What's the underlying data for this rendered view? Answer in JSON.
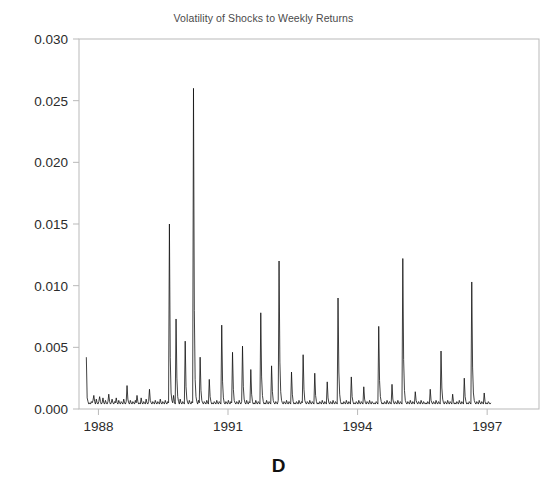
{
  "chart_data": {
    "type": "line",
    "title": "Volatility of Shocks to Weekly Returns",
    "panel_label": "D",
    "xlabel": "",
    "ylabel": "",
    "xlim": [
      1987.55,
      1998.2
    ],
    "ylim": [
      0.0,
      0.03
    ],
    "grid": false,
    "legend": null,
    "series_name": "volatility",
    "line_color": "#111111",
    "line_width": 0.8,
    "axis_color": "#b9b9b9",
    "xticks": [
      1988,
      1991,
      1994,
      1997
    ],
    "xtick_labels": [
      "1988",
      "1991",
      "1994",
      "1997"
    ],
    "yticks": [
      0.0,
      0.005,
      0.01,
      0.015,
      0.02,
      0.025,
      0.03
    ],
    "ytick_labels": [
      "0.000",
      "0.005",
      "0.010",
      "0.015",
      "0.020",
      "0.025",
      "0.030"
    ],
    "x_start": 1987.72,
    "x_step": 0.019230769,
    "values": [
      0.0042,
      0.0009,
      0.0006,
      0.0004,
      0.0005,
      0.0004,
      0.0006,
      0.0005,
      0.0007,
      0.0011,
      0.0006,
      0.0004,
      0.0008,
      0.0005,
      0.0004,
      0.0006,
      0.001,
      0.0006,
      0.0004,
      0.0005,
      0.0009,
      0.0005,
      0.0004,
      0.0007,
      0.0005,
      0.0004,
      0.0006,
      0.0012,
      0.0006,
      0.0004,
      0.0005,
      0.0008,
      0.0005,
      0.0004,
      0.0006,
      0.0005,
      0.0009,
      0.0005,
      0.0004,
      0.0007,
      0.0005,
      0.0004,
      0.0006,
      0.0005,
      0.0004,
      0.0008,
      0.0005,
      0.0004,
      0.0006,
      0.0019,
      0.0008,
      0.0005,
      0.0004,
      0.0007,
      0.0005,
      0.0004,
      0.0006,
      0.0005,
      0.0004,
      0.0007,
      0.0005,
      0.0011,
      0.0006,
      0.0004,
      0.0005,
      0.0004,
      0.0009,
      0.0005,
      0.0004,
      0.0006,
      0.0005,
      0.0004,
      0.0008,
      0.0005,
      0.0004,
      0.0006,
      0.0016,
      0.0007,
      0.0005,
      0.0004,
      0.0006,
      0.0005,
      0.0004,
      0.0007,
      0.0005,
      0.0004,
      0.0006,
      0.0005,
      0.0004,
      0.0008,
      0.0005,
      0.0004,
      0.0006,
      0.0005,
      0.0004,
      0.0007,
      0.0005,
      0.0004,
      0.0006,
      0.0005,
      0.015,
      0.0042,
      0.0013,
      0.0007,
      0.0005,
      0.0011,
      0.0006,
      0.0004,
      0.0073,
      0.0025,
      0.001,
      0.0006,
      0.0004,
      0.0008,
      0.0005,
      0.0004,
      0.0006,
      0.0005,
      0.0004,
      0.0055,
      0.0018,
      0.0008,
      0.0005,
      0.0004,
      0.0007,
      0.0005,
      0.0004,
      0.0006,
      0.0005,
      0.026,
      0.008,
      0.0024,
      0.001,
      0.0006,
      0.0004,
      0.0007,
      0.0005,
      0.0042,
      0.0015,
      0.0007,
      0.0005,
      0.0004,
      0.0006,
      0.0005,
      0.0004,
      0.0007,
      0.0005,
      0.0004,
      0.0024,
      0.001,
      0.0006,
      0.0004,
      0.0005,
      0.0004,
      0.0006,
      0.0005,
      0.0004,
      0.0007,
      0.0005,
      0.0004,
      0.0006,
      0.0005,
      0.0004,
      0.0068,
      0.0022,
      0.0009,
      0.0005,
      0.0004,
      0.0006,
      0.0005,
      0.0004,
      0.0007,
      0.0005,
      0.0004,
      0.0006,
      0.0005,
      0.0046,
      0.0016,
      0.0007,
      0.0005,
      0.0004,
      0.0006,
      0.0005,
      0.0004,
      0.0007,
      0.0005,
      0.0004,
      0.0006,
      0.0051,
      0.0018,
      0.0008,
      0.0005,
      0.0004,
      0.0007,
      0.0005,
      0.0004,
      0.0006,
      0.0005,
      0.0032,
      0.0012,
      0.0006,
      0.0004,
      0.0005,
      0.0004,
      0.0007,
      0.0005,
      0.0004,
      0.0006,
      0.0005,
      0.0004,
      0.0078,
      0.0026,
      0.0011,
      0.0006,
      0.0004,
      0.0005,
      0.0004,
      0.0007,
      0.0005,
      0.0004,
      0.0006,
      0.0005,
      0.0004,
      0.0035,
      0.0014,
      0.0007,
      0.0005,
      0.0004,
      0.0006,
      0.0005,
      0.0004,
      0.0007,
      0.012,
      0.0038,
      0.0014,
      0.0007,
      0.0005,
      0.0004,
      0.0006,
      0.0005,
      0.0004,
      0.0007,
      0.0005,
      0.0004,
      0.0006,
      0.0005,
      0.0004,
      0.003,
      0.0012,
      0.0006,
      0.0004,
      0.0005,
      0.0004,
      0.0006,
      0.0005,
      0.0004,
      0.0007,
      0.0005,
      0.0004,
      0.0006,
      0.0005,
      0.0044,
      0.0016,
      0.0007,
      0.0005,
      0.0004,
      0.0006,
      0.0005,
      0.0004,
      0.0007,
      0.0005,
      0.0004,
      0.0006,
      0.0005,
      0.0004,
      0.0029,
      0.0011,
      0.0006,
      0.0004,
      0.0005,
      0.0004,
      0.0006,
      0.0005,
      0.0004,
      0.0007,
      0.0005,
      0.0004,
      0.0006,
      0.0005,
      0.0004,
      0.0022,
      0.0009,
      0.0005,
      0.0004,
      0.0006,
      0.0005,
      0.0004,
      0.0007,
      0.0005,
      0.0004,
      0.0006,
      0.0005,
      0.0004,
      0.009,
      0.003,
      0.0012,
      0.0006,
      0.0004,
      0.0005,
      0.0004,
      0.0006,
      0.0005,
      0.0004,
      0.0007,
      0.0005,
      0.0004,
      0.0006,
      0.0005,
      0.0004,
      0.0026,
      0.001,
      0.0006,
      0.0004,
      0.0005,
      0.0004,
      0.0006,
      0.0005,
      0.0004,
      0.0007,
      0.0005,
      0.0004,
      0.0006,
      0.0005,
      0.0004,
      0.0018,
      0.0008,
      0.0005,
      0.0004,
      0.0006,
      0.0005,
      0.0004,
      0.0007,
      0.0005,
      0.0004,
      0.0006,
      0.0005,
      0.0004,
      0.0005,
      0.0004,
      0.0006,
      0.0005,
      0.0004,
      0.0067,
      0.0023,
      0.001,
      0.0006,
      0.0004,
      0.0005,
      0.0004,
      0.0006,
      0.0005,
      0.0004,
      0.0007,
      0.0005,
      0.0004,
      0.0006,
      0.0005,
      0.0004,
      0.002,
      0.0008,
      0.0005,
      0.0004,
      0.0006,
      0.0005,
      0.0004,
      0.0007,
      0.0005,
      0.0004,
      0.0006,
      0.0005,
      0.0004,
      0.0122,
      0.004,
      0.0015,
      0.0007,
      0.0005,
      0.0004,
      0.0006,
      0.0005,
      0.0004,
      0.0007,
      0.0005,
      0.0004,
      0.0006,
      0.0005,
      0.0004,
      0.0014,
      0.0007,
      0.0005,
      0.0004,
      0.0006,
      0.0005,
      0.0004,
      0.0007,
      0.0005,
      0.0004,
      0.0006,
      0.0005,
      0.0004,
      0.0005,
      0.0004,
      0.0006,
      0.0005,
      0.0004,
      0.0016,
      0.0007,
      0.0005,
      0.0004,
      0.0006,
      0.0005,
      0.0004,
      0.0007,
      0.0005,
      0.0004,
      0.0006,
      0.0005,
      0.0004,
      0.0047,
      0.0017,
      0.0008,
      0.0005,
      0.0004,
      0.0006,
      0.0005,
      0.0004,
      0.0007,
      0.0005,
      0.0004,
      0.0006,
      0.0005,
      0.0004,
      0.0012,
      0.0006,
      0.0004,
      0.0005,
      0.0004,
      0.0006,
      0.0005,
      0.0004,
      0.0007,
      0.0005,
      0.0004,
      0.0006,
      0.0005,
      0.0004,
      0.0025,
      0.001,
      0.0006,
      0.0004,
      0.0005,
      0.0004,
      0.0006,
      0.0005,
      0.0004,
      0.0103,
      0.0034,
      0.0013,
      0.0007,
      0.0005,
      0.0004,
      0.0006,
      0.0005,
      0.0004,
      0.0007,
      0.0005,
      0.0004,
      0.0006,
      0.0005,
      0.0004,
      0.0013,
      0.0006,
      0.0004,
      0.0005,
      0.0004,
      0.0006,
      0.0005,
      0.0004,
      0.0005
    ]
  },
  "plot_geometry": {
    "left": 79,
    "right": 539,
    "top": 39,
    "bottom": 409,
    "data_left": 107,
    "data_right": 513
  }
}
